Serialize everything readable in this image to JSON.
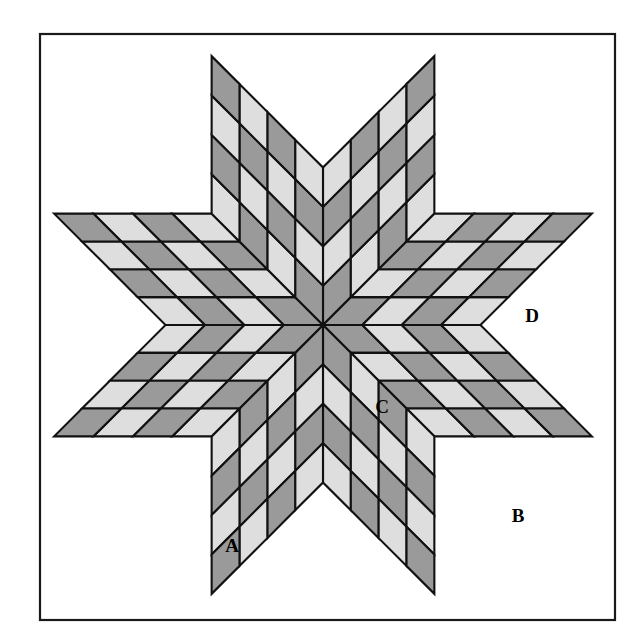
{
  "figure": {
    "kind": "quilt-block-diagram"
  },
  "colors": {
    "background": "#ffffff",
    "frame_stroke": "#1a1a1a",
    "piece_stroke": "#111111",
    "light_patch": "#dedede",
    "dark_patch": "#9a9a9a",
    "corner_white": "#ffffff",
    "label_text": "#000000"
  },
  "frame": {
    "x": 40,
    "y": 34,
    "width": 575,
    "height": 586
  },
  "star": {
    "center_x": 323,
    "center_y": 325,
    "points": 8,
    "grid_per_point": 4,
    "tip_top_y": 34,
    "tip_bottom_y": 620,
    "tip_left_x": 40,
    "tip_right_x": 615,
    "shade_sequence_note": "alternating light/dark diamonds per 4x4 point"
  },
  "labels": [
    {
      "id": "A",
      "text": "A",
      "x": 232,
      "y": 548,
      "describes": "light diamond in lower-left star point"
    },
    {
      "id": "B",
      "text": "B",
      "x": 518,
      "y": 518,
      "describes": "white corner square, lower right"
    },
    {
      "id": "C",
      "text": "C",
      "x": 382,
      "y": 409,
      "describes": "light diamond near center right"
    },
    {
      "id": "D",
      "text": "D",
      "x": 532,
      "y": 318,
      "describes": "white side triangle, right"
    }
  ],
  "chart_data": {
    "type": "diagram",
    "legend": [
      "A = light diamond patch",
      "B = corner square",
      "C = light diamond patch",
      "D = side setting triangle"
    ]
  }
}
